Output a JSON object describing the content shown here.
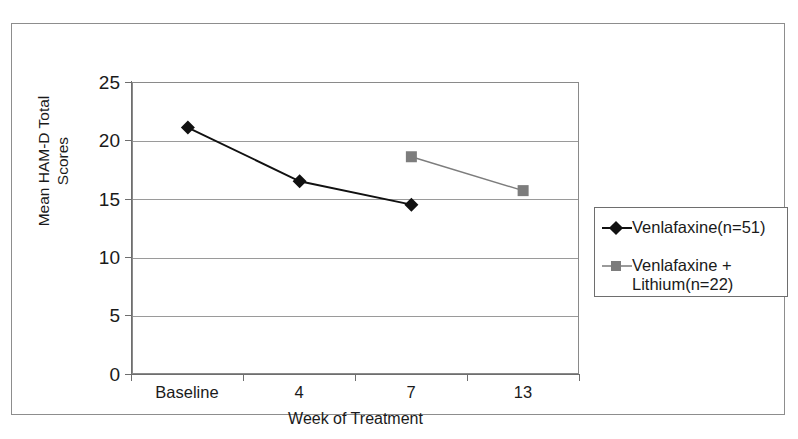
{
  "figure": {
    "background_color": "#ffffff",
    "frame_color": "#8d8d8d"
  },
  "chart_data": {
    "type": "line",
    "title": "",
    "subtitle": "",
    "xlabel": "Week of Treatment",
    "ylabel": "Mean HAM-D Total Scores",
    "categories": [
      "Baseline",
      "4",
      "7",
      "13"
    ],
    "x_tick_labels": [
      "Baseline",
      "4",
      "7",
      "13"
    ],
    "y_tick_labels": [
      "0",
      "5",
      "10",
      "15",
      "20",
      "25"
    ],
    "y_ticks": [
      0,
      5,
      10,
      15,
      20,
      25
    ],
    "ylim": [
      0,
      25
    ],
    "grid": "horizontal",
    "legend_position": "right-outside",
    "series": [
      {
        "name": "Venlafaxine(n=51)",
        "marker": "diamond",
        "color": "#111111",
        "x": [
          "Baseline",
          "4",
          "7"
        ],
        "values": [
          21.1,
          16.5,
          14.5
        ]
      },
      {
        "name": "Venlafaxine + Lithium(n=22)",
        "marker": "square",
        "color": "#7d7d7d",
        "x": [
          "7",
          "13"
        ],
        "values": [
          18.6,
          15.7
        ]
      }
    ]
  },
  "legend": {
    "entries": [
      {
        "label": "Venlafaxine(n=51)",
        "marker": "diamond-marker",
        "color": "#111111"
      },
      {
        "label": "Venlafaxine +\nLithium(n=22)",
        "marker": "square-marker",
        "color": "#7d7d7d"
      }
    ]
  }
}
